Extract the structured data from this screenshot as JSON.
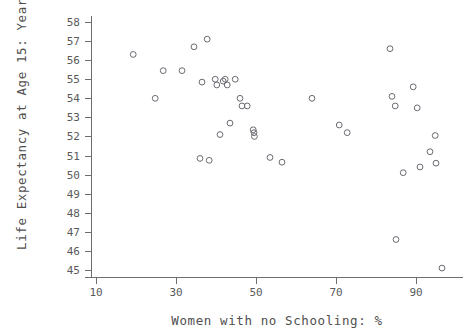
{
  "chart_data": {
    "type": "scatter",
    "title": "",
    "xlabel": "Women with no Schooling: %",
    "ylabel": "Life Expectancy at Age 15: Years",
    "xlim": [
      6,
      100
    ],
    "ylim": [
      44.4,
      58.6
    ],
    "xticks": [
      10,
      30,
      50,
      70,
      90
    ],
    "yticks": [
      45,
      46,
      47,
      48,
      49,
      50,
      51,
      52,
      53,
      54,
      55,
      56,
      57,
      58
    ],
    "grid": false,
    "legend": null,
    "marker": "open-circle",
    "marker_color": "#6a6a72",
    "points": [
      {
        "x": 19.3,
        "y": 56.3
      },
      {
        "x": 24.8,
        "y": 54.0
      },
      {
        "x": 26.8,
        "y": 55.45
      },
      {
        "x": 31.5,
        "y": 55.45
      },
      {
        "x": 34.5,
        "y": 56.7
      },
      {
        "x": 36.0,
        "y": 50.85
      },
      {
        "x": 36.5,
        "y": 54.85
      },
      {
        "x": 37.8,
        "y": 57.1
      },
      {
        "x": 38.3,
        "y": 50.75
      },
      {
        "x": 39.8,
        "y": 55.0
      },
      {
        "x": 40.2,
        "y": 54.7
      },
      {
        "x": 41.0,
        "y": 52.1
      },
      {
        "x": 41.8,
        "y": 54.9
      },
      {
        "x": 42.3,
        "y": 55.0
      },
      {
        "x": 42.8,
        "y": 54.7
      },
      {
        "x": 43.5,
        "y": 52.7
      },
      {
        "x": 44.8,
        "y": 55.0
      },
      {
        "x": 46.0,
        "y": 54.0
      },
      {
        "x": 46.5,
        "y": 53.6
      },
      {
        "x": 47.8,
        "y": 53.6
      },
      {
        "x": 49.3,
        "y": 52.35
      },
      {
        "x": 49.5,
        "y": 52.2
      },
      {
        "x": 49.6,
        "y": 52.0
      },
      {
        "x": 53.5,
        "y": 50.9
      },
      {
        "x": 56.5,
        "y": 50.65
      },
      {
        "x": 64.0,
        "y": 54.0
      },
      {
        "x": 70.8,
        "y": 52.6
      },
      {
        "x": 72.8,
        "y": 52.2
      },
      {
        "x": 83.5,
        "y": 56.6
      },
      {
        "x": 84.0,
        "y": 54.1
      },
      {
        "x": 84.8,
        "y": 53.6
      },
      {
        "x": 85.0,
        "y": 46.6
      },
      {
        "x": 86.8,
        "y": 50.1
      },
      {
        "x": 89.3,
        "y": 54.6
      },
      {
        "x": 90.3,
        "y": 53.5
      },
      {
        "x": 91.0,
        "y": 50.4
      },
      {
        "x": 93.5,
        "y": 51.2
      },
      {
        "x": 94.8,
        "y": 52.05
      },
      {
        "x": 95.0,
        "y": 50.6
      },
      {
        "x": 96.5,
        "y": 45.1
      }
    ]
  },
  "axes": {
    "y_title": "Life Expectancy at Age 15: Years",
    "x_title": "Women with no Schooling: %",
    "x_tick_labels": [
      "10",
      "30",
      "50",
      "70",
      "90"
    ],
    "y_tick_labels": [
      "58",
      "57",
      "56",
      "55",
      "54",
      "53",
      "52",
      "51",
      "50",
      "49",
      "48",
      "47",
      "46",
      "45"
    ]
  }
}
